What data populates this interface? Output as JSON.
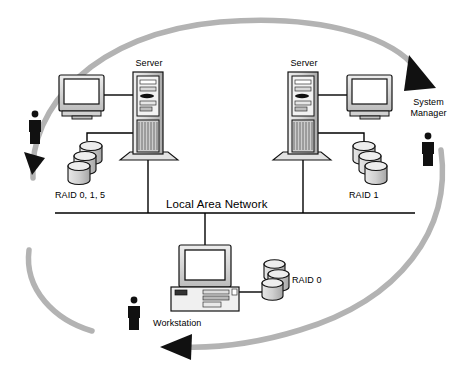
{
  "diagram": {
    "canvas": {
      "width": 469,
      "height": 370,
      "background": "#ffffff"
    },
    "colors": {
      "line": "#000000",
      "arc": "#b3b3b3",
      "arrow": "#111111",
      "device_fill": "#ffffff",
      "device_shade": "#c8c8c8",
      "device_dark": "#8c8c8c",
      "screen": "#ffffff",
      "person": "#111111"
    },
    "labels": {
      "server_left": "Server",
      "server_right": "Server",
      "raid_left": "RAID 0, 1,  5",
      "raid_right": "RAID 1",
      "raid_workstation": "RAID 0",
      "lan": "Local Area Network",
      "workstation": "Workstation",
      "system_manager_line1": "System",
      "system_manager_line2": "Manager"
    },
    "nodes": [
      {
        "name": "server-left",
        "type": "tower-server",
        "label": "Server",
        "x": 138,
        "y": 120
      },
      {
        "name": "server-right",
        "type": "tower-server",
        "label": "Server",
        "x": 295,
        "y": 120
      },
      {
        "name": "monitor-left",
        "type": "crt-monitor",
        "x": 82,
        "y": 95
      },
      {
        "name": "monitor-right",
        "type": "crt-monitor",
        "x": 352,
        "y": 95
      },
      {
        "name": "workstation",
        "type": "desktop-workstation",
        "label": "Workstation",
        "x": 205,
        "y": 275
      },
      {
        "name": "disk-stack-left",
        "type": "disk-stack",
        "label": "RAID 0, 1,  5",
        "count": 3,
        "x": 87,
        "y": 155
      },
      {
        "name": "disk-stack-right",
        "type": "disk-stack",
        "label": "RAID 1",
        "count": 3,
        "x": 360,
        "y": 155
      },
      {
        "name": "disk-stack-workstation",
        "type": "disk-stack",
        "label": "RAID 0",
        "count": 3,
        "x": 272,
        "y": 283
      },
      {
        "name": "person-left",
        "type": "person",
        "x": 35,
        "y": 126
      },
      {
        "name": "person-bottom",
        "type": "person",
        "x": 134,
        "y": 312
      },
      {
        "name": "person-system-manager",
        "type": "person",
        "label": "System Manager",
        "x": 428,
        "y": 148
      }
    ],
    "bus": {
      "name": "local-area-network-bus",
      "label": "Local Area Network",
      "y": 213,
      "x1": 55,
      "x2": 415
    },
    "flow_arrows": [
      {
        "name": "arrow-top-right",
        "direction": "clockwise-to-system-manager"
      },
      {
        "name": "arrow-bottom-left",
        "direction": "leftward"
      },
      {
        "name": "arrow-left-up",
        "direction": "upward"
      }
    ]
  }
}
